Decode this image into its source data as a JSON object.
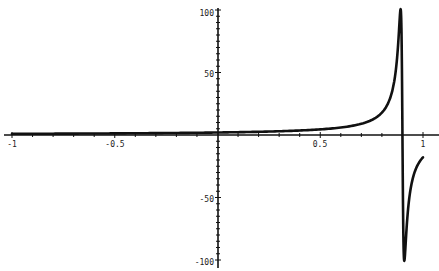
{
  "chart_data": {
    "type": "line",
    "title": "",
    "xlabel": "",
    "ylabel": "",
    "xlim": [
      -1,
      1
    ],
    "ylim": [
      -100,
      100
    ],
    "grid": false,
    "legend": null,
    "x_ticks": [
      -1,
      -0.5,
      0.5,
      1
    ],
    "x_tick_labels": [
      "-1",
      "-0.5",
      "0.5",
      "1"
    ],
    "y_ticks": [
      100,
      50,
      -50,
      -100
    ],
    "y_tick_labels": [
      "100",
      "50",
      "-50",
      "-100"
    ],
    "series": [
      {
        "name": "f(x)",
        "color": "#111111",
        "x": [
          -1,
          -0.8,
          -0.6,
          -0.4,
          -0.2,
          0,
          0.2,
          0.4,
          0.5,
          0.6,
          0.7,
          0.75,
          0.8,
          0.84,
          0.86,
          0.88,
          0.89,
          0.895,
          0.9,
          0.905,
          0.91,
          0.92,
          0.94,
          0.96,
          0.98,
          1.0
        ],
        "y": [
          0.95,
          1.06,
          1.2,
          1.38,
          1.64,
          2.0,
          2.57,
          3.6,
          4.5,
          6.0,
          9.0,
          12.0,
          18.0,
          29.9,
          44.8,
          86.5,
          99.6,
          78.3,
          0,
          -78.3,
          -99.6,
          -86.5,
          -44.8,
          -29.9,
          -22.4,
          -18.0
        ]
      }
    ]
  },
  "axes": {
    "x_labels": [
      "-1",
      "-0.5",
      "0.5",
      "1"
    ],
    "y_labels": [
      "100",
      "50",
      "-50",
      "-100"
    ]
  }
}
